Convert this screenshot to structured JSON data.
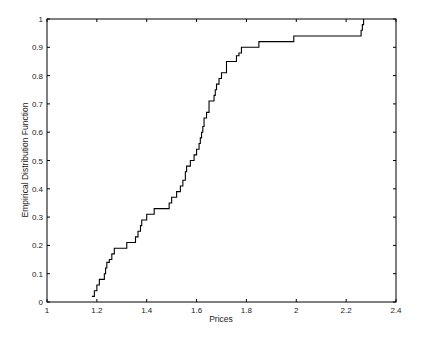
{
  "chart_data": {
    "type": "line",
    "subtype": "empirical_cdf_step",
    "title": "",
    "xlabel": "Prices",
    "ylabel": "Empirical Distribution Function",
    "xlim": [
      1,
      2.4
    ],
    "ylim": [
      0,
      1
    ],
    "xticks": [
      1,
      1.2,
      1.4,
      1.6,
      1.8,
      2,
      2.2,
      2.4
    ],
    "xtick_labels": [
      "1",
      "1.2",
      "1.4",
      "1.6",
      "1.8",
      "2",
      "2.2",
      "2.4"
    ],
    "yticks": [
      0,
      0.1,
      0.2,
      0.3,
      0.4,
      0.5,
      0.6,
      0.7,
      0.8,
      0.9,
      1
    ],
    "ytick_labels": [
      "0",
      "0.1",
      "0.2",
      "0.3",
      "0.4",
      "0.5",
      "0.6",
      "0.7",
      "0.8",
      "0.9",
      "1"
    ],
    "grid": false,
    "legend": null,
    "line_color": "#000000",
    "series": [
      {
        "name": "ECDF",
        "x": [
          1.18,
          1.19,
          1.2,
          1.21,
          1.23,
          1.235,
          1.24,
          1.25,
          1.26,
          1.27,
          1.32,
          1.355,
          1.365,
          1.375,
          1.38,
          1.4,
          1.43,
          1.49,
          1.5,
          1.52,
          1.535,
          1.545,
          1.555,
          1.56,
          1.575,
          1.59,
          1.6,
          1.61,
          1.615,
          1.62,
          1.625,
          1.63,
          1.64,
          1.65,
          1.67,
          1.675,
          1.68,
          1.69,
          1.7,
          1.72,
          1.76,
          1.77,
          1.78,
          1.85,
          1.99,
          2.26,
          2.265,
          2.27
        ],
        "y": [
          0.02,
          0.04,
          0.06,
          0.08,
          0.1,
          0.12,
          0.14,
          0.15,
          0.17,
          0.19,
          0.21,
          0.23,
          0.25,
          0.27,
          0.29,
          0.31,
          0.33,
          0.35,
          0.37,
          0.39,
          0.41,
          0.43,
          0.46,
          0.48,
          0.5,
          0.52,
          0.54,
          0.56,
          0.58,
          0.6,
          0.62,
          0.65,
          0.67,
          0.71,
          0.73,
          0.75,
          0.77,
          0.79,
          0.81,
          0.85,
          0.87,
          0.88,
          0.9,
          0.92,
          0.94,
          0.96,
          0.98,
          1.0
        ]
      }
    ]
  }
}
